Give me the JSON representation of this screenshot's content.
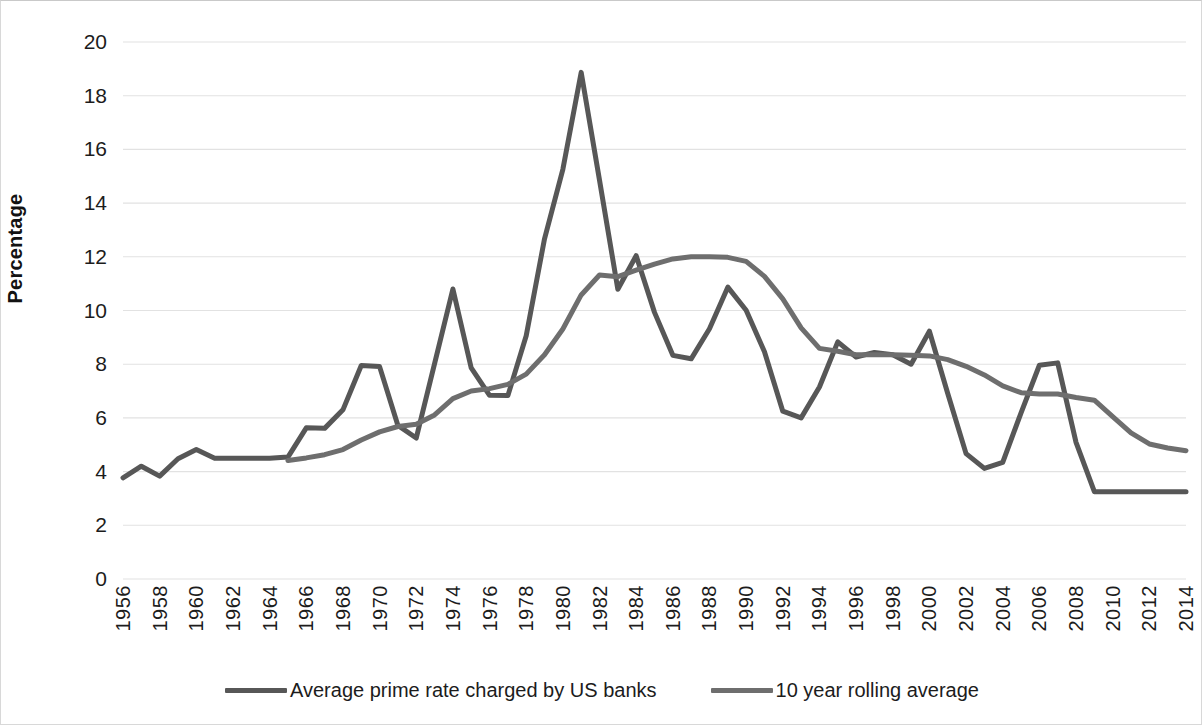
{
  "axes": {
    "y_title": "Percentage",
    "y_ticks": [
      "0",
      "2",
      "4",
      "6",
      "8",
      "10",
      "12",
      "14",
      "16",
      "18",
      "20"
    ],
    "x_ticks": [
      "1956",
      "1958",
      "1960",
      "1962",
      "1964",
      "1966",
      "1968",
      "1970",
      "1972",
      "1974",
      "1976",
      "1978",
      "1980",
      "1982",
      "1984",
      "1986",
      "1988",
      "1990",
      "1992",
      "1994",
      "1996",
      "1998",
      "2000",
      "2002",
      "2004",
      "2006",
      "2008",
      "2010",
      "2012",
      "2014"
    ]
  },
  "legend": {
    "items": [
      {
        "label": "Average prime rate charged by US banks",
        "color": "#575757"
      },
      {
        "label": "10 year rolling average",
        "color": "#6e6e6e"
      }
    ]
  },
  "colors": {
    "prime_rate": "#575757",
    "rolling_average": "#6e6e6e",
    "gridline": "#e2e2e2",
    "background": "#ffffff",
    "frame": "#d8d8d8",
    "text": "#1c1c1c"
  },
  "chart_data": {
    "type": "line",
    "title": "",
    "subtitle": "",
    "xlabel": "",
    "ylabel": "Percentage",
    "xlim": [
      1956,
      2014
    ],
    "ylim": [
      0,
      20
    ],
    "y_tick_step": 2,
    "x_tick_step": 2,
    "grid": "horizontal",
    "legend_position": "bottom",
    "x": [
      1956,
      1957,
      1958,
      1959,
      1960,
      1961,
      1962,
      1963,
      1964,
      1965,
      1966,
      1967,
      1968,
      1969,
      1970,
      1971,
      1972,
      1973,
      1974,
      1975,
      1976,
      1977,
      1978,
      1979,
      1980,
      1981,
      1982,
      1983,
      1984,
      1985,
      1986,
      1987,
      1988,
      1989,
      1990,
      1991,
      1992,
      1993,
      1994,
      1995,
      1996,
      1997,
      1998,
      1999,
      2000,
      2001,
      2002,
      2003,
      2004,
      2005,
      2006,
      2007,
      2008,
      2009,
      2010,
      2011,
      2012,
      2013,
      2014
    ],
    "series": [
      {
        "name": "Average prime rate charged by US banks",
        "color": "#575757",
        "values": [
          3.77,
          4.2,
          3.83,
          4.48,
          4.82,
          4.5,
          4.5,
          4.5,
          4.5,
          4.54,
          5.63,
          5.61,
          6.3,
          7.95,
          7.91,
          5.72,
          5.25,
          8.02,
          10.8,
          7.86,
          6.84,
          6.83,
          9.06,
          12.67,
          15.26,
          18.87,
          14.85,
          10.79,
          12.04,
          9.93,
          8.33,
          8.2,
          9.32,
          10.87,
          10.01,
          8.46,
          6.25,
          6.0,
          7.15,
          8.83,
          8.27,
          8.44,
          8.35,
          8.0,
          9.23,
          6.91,
          4.67,
          4.12,
          4.34,
          6.19,
          7.96,
          8.05,
          5.09,
          3.25,
          3.25,
          3.25,
          3.25,
          3.25,
          3.25
        ]
      },
      {
        "name": "10 year rolling average",
        "color": "#6e6e6e",
        "values": [
          null,
          null,
          null,
          null,
          null,
          null,
          null,
          null,
          null,
          4.41,
          4.51,
          4.63,
          4.82,
          5.18,
          5.48,
          5.68,
          5.76,
          6.11,
          6.72,
          7.0,
          7.09,
          7.25,
          7.63,
          8.35,
          9.31,
          10.58,
          11.32,
          11.26,
          11.5,
          11.73,
          11.92,
          12.0,
          12.0,
          11.98,
          11.83,
          11.27,
          10.43,
          9.35,
          8.59,
          8.48,
          8.35,
          8.35,
          8.35,
          8.33,
          8.31,
          8.17,
          7.92,
          7.6,
          7.19,
          6.94,
          6.89,
          6.89,
          6.76,
          6.66,
          6.05,
          5.44,
          5.03,
          4.88,
          4.78
        ]
      }
    ]
  }
}
